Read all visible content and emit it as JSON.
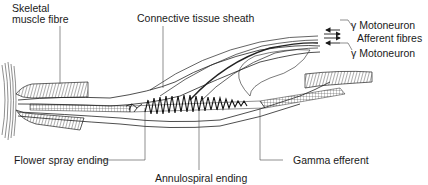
{
  "diagram": {
    "labels": {
      "skeletal_muscle_fibre_line1": "Skeletal",
      "skeletal_muscle_fibre_line2": "muscle fibre",
      "connective_tissue_sheath": "Connective tissue sheath",
      "gamma_motoneuron_top": "γ Motoneuron",
      "afferent_fibres": "Afferent fibres",
      "gamma_motoneuron_bottom": "γ Motoneuron",
      "flower_spray_ending": "Flower spray ending",
      "annulospiral_ending": "Annulospiral ending",
      "gamma_efferent": "Gamma efferent"
    },
    "arrows": [
      {
        "label": "γ Motoneuron (top)",
        "direction": "left"
      },
      {
        "label": "Afferent fibres",
        "direction": "right",
        "count": 2
      },
      {
        "label": "γ Motoneuron (bottom)",
        "direction": "left"
      }
    ],
    "colors": {
      "ink": "#1a1a1a",
      "background": "#ffffff"
    }
  }
}
